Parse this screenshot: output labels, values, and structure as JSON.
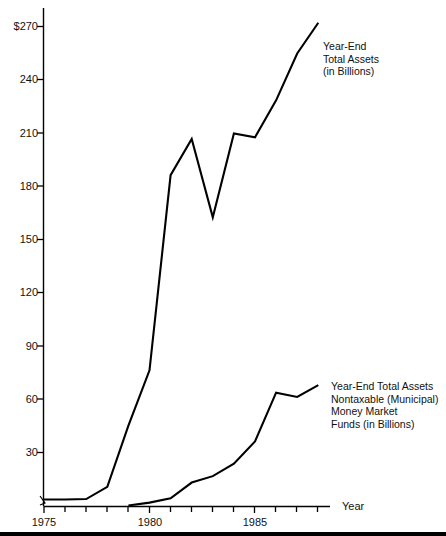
{
  "chart_data": {
    "type": "line",
    "title": "",
    "subtitle": "",
    "xlabel": "Year",
    "ylabel": "",
    "xlim": [
      1974.6,
      1989.0
    ],
    "ylim": [
      0,
      285
    ],
    "grid": false,
    "legend_position": "inline-annotations",
    "y_ticks": [
      "$270",
      "240",
      "210",
      "180",
      "150",
      "120",
      "90",
      "60",
      "30"
    ],
    "y_tick_values": [
      270,
      240,
      210,
      180,
      150,
      120,
      90,
      60,
      30
    ],
    "x_ticks": [
      "1975",
      "1980",
      "1985"
    ],
    "x_tick_values": [
      1975,
      1980,
      1985
    ],
    "x_minor_ticks": [
      1976,
      1977,
      1978,
      1979,
      1981,
      1982,
      1983,
      1984,
      1986,
      1987,
      1988
    ],
    "series": [
      {
        "name": "Year-End Total Assets (in Billions)",
        "x": [
          1975,
          1976,
          1977,
          1978,
          1979,
          1980,
          1981,
          1982,
          1983,
          1984,
          1985,
          1986,
          1987,
          1988
        ],
        "values": [
          3.7,
          3.7,
          3.9,
          10.8,
          45.2,
          76.4,
          186.2,
          206.6,
          162.5,
          209.7,
          207.5,
          228.3,
          254.7,
          272.0
        ]
      },
      {
        "name": "Year-End Total Assets Nontaxable (Municipal) Money Market Funds (in Billions)",
        "x": [
          1979,
          1980,
          1981,
          1982,
          1983,
          1984,
          1985,
          1986,
          1987,
          1988
        ],
        "values": [
          0.3,
          1.9,
          4.3,
          13.2,
          16.8,
          23.8,
          36.3,
          63.8,
          61.4,
          68.0
        ]
      }
    ],
    "annotations": [
      {
        "id": "upper-series-label",
        "lines": [
          "Year-End",
          "Total Assets",
          "(in Billions)"
        ],
        "x_px": 323,
        "y_px": 40
      },
      {
        "id": "lower-series-label",
        "lines": [
          "Year-End Total Assets",
          "Nontaxable (Municipal)",
          "Money Market",
          "Funds (in Billions)"
        ],
        "x_px": 331,
        "y_px": 380
      }
    ],
    "axis_label": {
      "text": "Year",
      "x_px": 342,
      "y_px": 503
    },
    "colors": {
      "line": "#000000",
      "axis": "#000000",
      "text": "#111111",
      "background": "#ffffff"
    }
  }
}
